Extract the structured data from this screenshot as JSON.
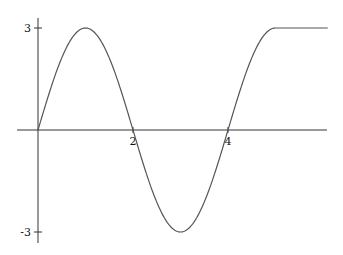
{
  "chart_data": {
    "type": "line",
    "title": "",
    "xlabel": "",
    "ylabel": "",
    "xlim": [
      -0.45,
      6.3
    ],
    "ylim": [
      -3.3,
      3.2
    ],
    "grid": false,
    "legend": null,
    "x_ticks": [
      {
        "value": 2,
        "label": "2"
      },
      {
        "value": 4,
        "label": "4"
      }
    ],
    "y_ticks": [
      {
        "value": 3,
        "label": "3"
      },
      {
        "value": -3,
        "label": "-3"
      }
    ],
    "series": [
      {
        "name": "f(x)",
        "description": "3·sin(πx/2) for 0 ≤ x ≤ 5, then constant 3 up to x ≈ 6.1",
        "x": [
          0,
          0.5,
          1,
          1.5,
          2,
          2.5,
          3,
          3.5,
          4,
          4.5,
          5,
          5.5,
          6.1
        ],
        "values": [
          0,
          2.12,
          3,
          2.12,
          0,
          -2.12,
          -3,
          -2.12,
          0,
          2.12,
          3,
          3,
          3
        ]
      }
    ],
    "colors": {
      "line": "#555555",
      "axis": "#333333"
    }
  }
}
